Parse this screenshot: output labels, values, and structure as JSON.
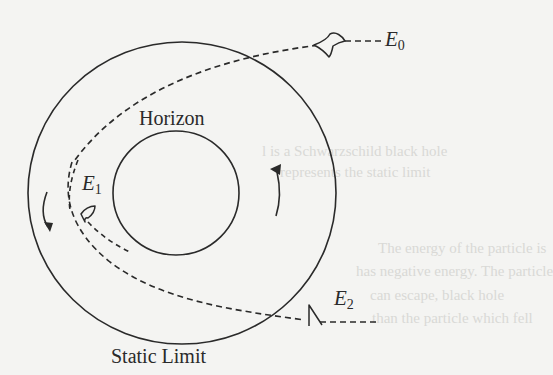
{
  "figure": {
    "labels": {
      "horizon": "Horizon",
      "static_limit": "Static Limit",
      "e0_base": "E",
      "e0_sub": "0",
      "e1_base": "E",
      "e1_sub": "1",
      "e2_base": "E",
      "e2_sub": "2"
    },
    "bleed_through_text": [
      "l is a Schwarzschild black hole",
      "represents the static limit",
      "The energy of the particle is",
      "has negative energy. The particle",
      "can escape, black hole",
      "than the particle which fell"
    ],
    "colors": {
      "ink": "#2a2a2a",
      "paper": "#f4f4f2",
      "bleed": "#d9d9d6"
    }
  }
}
